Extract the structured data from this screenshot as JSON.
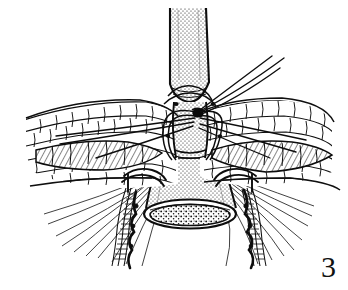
{
  "figure": {
    "number_label": "3",
    "caption_text": "",
    "medium": "pen-and-ink line drawing",
    "background_color": "#ffffff",
    "ink_color": "#101010"
  },
  "canvas": {
    "width": 348,
    "height": 290
  },
  "structures": [
    {
      "id": "proximal-tube",
      "name": "proximal-conduit-tube",
      "description": "vertical stippled cylindrical tube descending from the top edge",
      "fill_pattern": "fine-stipple",
      "bbox": [
        168,
        8,
        40,
        96
      ]
    },
    {
      "id": "abdominal-wall-left",
      "name": "abdominal-wall-layers-left",
      "description": "layered cobblestone tissue (skin, fat, fascia, muscle) sloping down-left from the center",
      "fill_pattern": "cobblestone-cells",
      "bbox": [
        24,
        98,
        146,
        86
      ]
    },
    {
      "id": "abdominal-wall-right",
      "name": "abdominal-wall-layers-right",
      "description": "layered cobblestone tissue sloping down-right from the center",
      "fill_pattern": "cobblestone-cells",
      "bbox": [
        180,
        98,
        150,
        86
      ]
    },
    {
      "id": "muscle-band-left",
      "name": "muscle-layer-left",
      "description": "shaded elongated muscle-fiber band set between the tissue layers on the left",
      "fill_pattern": "cross-hatch",
      "bbox": [
        30,
        140,
        130,
        30
      ]
    },
    {
      "id": "muscle-band-right",
      "name": "muscle-layer-right",
      "description": "shaded elongated muscle-fiber band set between the tissue layers on the right",
      "fill_pattern": "cross-hatch",
      "bbox": [
        205,
        138,
        125,
        30
      ]
    },
    {
      "id": "distal-cone",
      "name": "distal-flared-conduit",
      "description": "stippled funnel-shaped distal segment widening toward the open end",
      "fill_pattern": "fine-stipple",
      "bbox": [
        146,
        156,
        84,
        62
      ]
    },
    {
      "id": "lumen-opening",
      "name": "open-lumen-ellipse",
      "description": "elliptical open mouth of the conduit with a mucosal rim and granular interior",
      "fill_pattern": "coarse-stipple",
      "bbox": [
        144,
        200,
        92,
        30
      ]
    },
    {
      "id": "deep-tissue-fan",
      "name": "deep-tissue-hatch-fan",
      "description": "radiating hatched serosal/peritoneal tissue fanning downward and outward beneath the wall",
      "fill_pattern": "parallel-hatch-fan",
      "bbox": [
        40,
        176,
        268,
        100
      ]
    }
  ],
  "sutures": [
    {
      "id": "central-knot",
      "name": "central-suture-knot",
      "description": "dense tied knot where the anchoring sutures converge against the tube",
      "position": [
        197,
        113
      ]
    },
    {
      "id": "free-tails-upper-right",
      "name": "suture-free-ends-upper-right",
      "description": "pair of long free suture tails sweeping up and to the right",
      "count": 2
    },
    {
      "id": "purse-string-left",
      "name": "purse-string-suture-left",
      "description": "curved suture loop passing through the left side of the wall to the conduit",
      "count": 2
    },
    {
      "id": "purse-string-right",
      "name": "purse-string-suture-right",
      "description": "curved suture loop passing through the right side of the wall to the conduit",
      "count": 2
    },
    {
      "id": "anchor-left-distal",
      "name": "distal-anchor-suture-left",
      "description": "suture anchoring the left edge of the flared distal segment",
      "count": 1
    },
    {
      "id": "anchor-right-distal",
      "name": "distal-anchor-suture-right",
      "description": "suture anchoring the right edge of the flared distal segment",
      "count": 1
    }
  ]
}
